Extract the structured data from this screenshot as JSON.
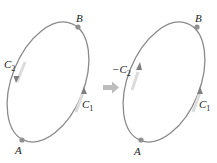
{
  "diagram": {
    "left_panel": {
      "points": [
        {
          "label": "A"
        },
        {
          "label": "B"
        }
      ],
      "curves": [
        {
          "label": "C",
          "subscript": "1",
          "direction": "A to B (upward, right side)"
        },
        {
          "label": "C",
          "subscript": "2",
          "direction": "B to A (downward, left side)"
        }
      ]
    },
    "arrow": {
      "meaning": "transforms-to",
      "color": "#b8b8b8"
    },
    "right_panel": {
      "points": [
        {
          "label": "A"
        },
        {
          "label": "B"
        }
      ],
      "curves": [
        {
          "label": "C",
          "subscript": "1",
          "direction": "A to B (upward, right side)"
        },
        {
          "label": "−C",
          "subscript": "2",
          "direction": "A to B (upward, left side)"
        }
      ]
    },
    "colors": {
      "curve": "#8a8a8a",
      "highlight": "#d8d8d8",
      "point": "#909090",
      "text": "#222222"
    }
  },
  "labels": {
    "A_left": "A",
    "B_left": "B",
    "C1_left": "C",
    "C1_left_sub": "1",
    "C2_left": "C",
    "C2_left_sub": "2",
    "A_right": "A",
    "B_right": "B",
    "C1_right": "C",
    "C1_right_sub": "1",
    "C2_right": "−C",
    "C2_right_sub": "2"
  }
}
